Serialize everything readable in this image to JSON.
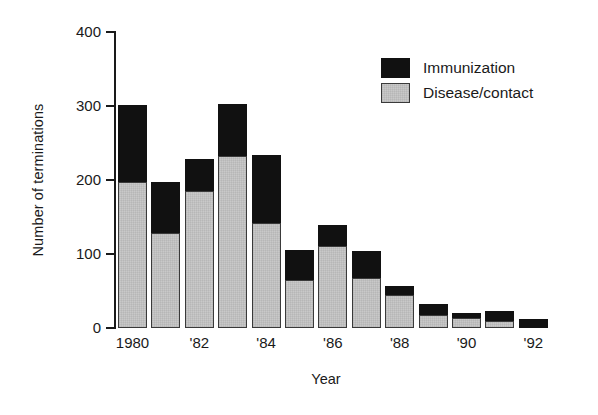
{
  "chart_data": {
    "type": "bar",
    "stacked": true,
    "title": "",
    "xlabel": "Year",
    "ylabel": "Number of terminations",
    "ylim": [
      0,
      400
    ],
    "yticks": [
      0,
      100,
      200,
      300,
      400
    ],
    "ytick_labels": [
      "0",
      "100",
      "200",
      "300",
      "400"
    ],
    "grid": false,
    "legend_position": "top-right",
    "categories": [
      1980,
      1981,
      1982,
      1983,
      1984,
      1985,
      1986,
      1987,
      1988,
      1989,
      1990,
      1991,
      1992
    ],
    "xtick_labels": [
      "1980",
      "",
      "'82",
      "",
      "'84",
      "",
      "'86",
      "",
      "'88",
      "",
      "'90",
      "",
      "'92"
    ],
    "series": [
      {
        "name": "Disease/contact",
        "color": "#c9c9c9",
        "values": [
          196,
          128,
          184,
          232,
          142,
          65,
          111,
          68,
          45,
          17,
          13,
          9,
          0
        ]
      },
      {
        "name": "Immunization",
        "color": "#111111",
        "values": [
          105,
          69,
          44,
          70,
          91,
          40,
          28,
          36,
          11,
          16,
          7,
          14,
          12
        ]
      }
    ],
    "totals": [
      301,
      197,
      228,
      302,
      233,
      105,
      139,
      104,
      56,
      33,
      20,
      23,
      12
    ]
  },
  "legend": {
    "items": [
      {
        "label": "Immunization",
        "swatch": "black"
      },
      {
        "label": "Disease/contact",
        "swatch": "gray"
      }
    ]
  }
}
